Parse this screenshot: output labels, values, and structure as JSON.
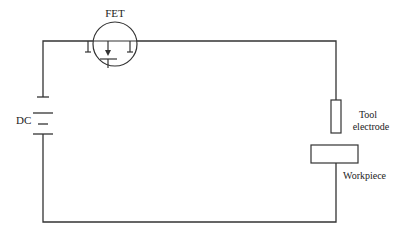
{
  "diagram": {
    "labels": {
      "fet": "FET",
      "dc": "DC",
      "tool_line1": "Tool",
      "tool_line2": "electrode",
      "workpiece": "Workpiece"
    },
    "colors": {
      "stroke": "#333333",
      "text": "#222222",
      "background": "#ffffff"
    },
    "components": [
      {
        "id": "fet",
        "type": "field-effect-transistor",
        "label": "FET"
      },
      {
        "id": "dc",
        "type": "dc-battery",
        "label": "DC"
      },
      {
        "id": "tool",
        "type": "tool-electrode",
        "label": "Tool electrode"
      },
      {
        "id": "workpiece",
        "type": "workpiece",
        "label": "Workpiece"
      }
    ]
  }
}
